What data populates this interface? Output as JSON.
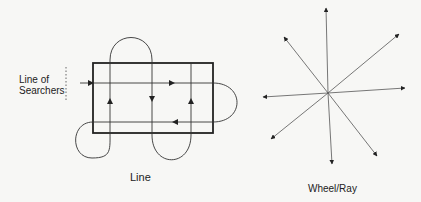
{
  "figure": {
    "panels": [
      {
        "id": "line",
        "caption": "Line",
        "annotation_line1": "Line of",
        "annotation_line2": "Searchers",
        "description": "Rectangle search area swept by a line of searchers moving in a serpentine path"
      },
      {
        "id": "wheel-ray",
        "caption": "Wheel/Ray",
        "ray_count": 8,
        "description": "Rays radiating outward from a central point"
      }
    ],
    "colors": {
      "background": "#f7f7f5",
      "stroke": "#333333",
      "text": "#222222"
    }
  }
}
